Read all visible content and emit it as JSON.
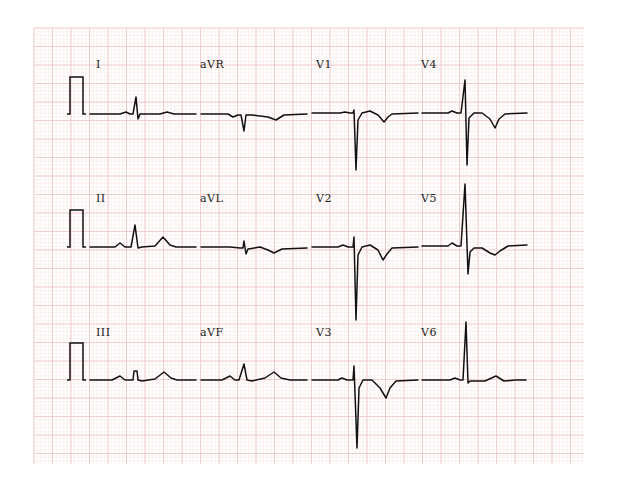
{
  "chart_data": {
    "type": "line",
    "grid": {
      "on": true,
      "x0": 34,
      "y0": 28,
      "x1": 584,
      "y1": 464,
      "major_px": 18.5,
      "minor_per_major": 5,
      "major_color": "#f0c8cc",
      "minor_color": "#fae8ea"
    },
    "layout": {
      "rows": 3,
      "columns": 4
    },
    "calibration_pulses": [
      {
        "row": 0,
        "x_left": 70,
        "x_right": 83,
        "baseline_y": 114,
        "top_y": 77
      },
      {
        "row": 1,
        "x_left": 70,
        "x_right": 83,
        "baseline_y": 247,
        "top_y": 210
      },
      {
        "row": 2,
        "x_left": 70,
        "x_right": 83,
        "baseline_y": 380,
        "top_y": 343
      }
    ],
    "leads": [
      {
        "name": "I",
        "label_x": 96,
        "label_y": 68,
        "baseline": 114,
        "points": [
          [
            90,
            114
          ],
          [
            120,
            114
          ],
          [
            126,
            112
          ],
          [
            130,
            114
          ],
          [
            133,
            114
          ],
          [
            136,
            97
          ],
          [
            138,
            119
          ],
          [
            140,
            114
          ],
          [
            160,
            114
          ],
          [
            167,
            112
          ],
          [
            174,
            114
          ],
          [
            196,
            114
          ]
        ]
      },
      {
        "name": "aVR",
        "label_x": 200,
        "label_y": 68,
        "baseline": 114,
        "points": [
          [
            201,
            114
          ],
          [
            228,
            114
          ],
          [
            233,
            117
          ],
          [
            238,
            115
          ],
          [
            241,
            115
          ],
          [
            244,
            131
          ],
          [
            246,
            115
          ],
          [
            252,
            115
          ],
          [
            268,
            117
          ],
          [
            276,
            120
          ],
          [
            284,
            115
          ],
          [
            307,
            114
          ]
        ]
      },
      {
        "name": "V1",
        "label_x": 316,
        "label_y": 68,
        "baseline": 113,
        "points": [
          [
            312,
            113
          ],
          [
            340,
            113
          ],
          [
            345,
            112
          ],
          [
            350,
            113
          ],
          [
            353,
            113
          ],
          [
            354,
            110
          ],
          [
            356,
            170
          ],
          [
            358,
            120
          ],
          [
            362,
            113
          ],
          [
            370,
            111
          ],
          [
            378,
            115
          ],
          [
            384,
            122
          ],
          [
            388,
            117
          ],
          [
            392,
            114
          ],
          [
            418,
            113
          ]
        ]
      },
      {
        "name": "V4",
        "label_x": 421,
        "label_y": 68,
        "baseline": 113,
        "points": [
          [
            422,
            113
          ],
          [
            448,
            113
          ],
          [
            452,
            111
          ],
          [
            457,
            113
          ],
          [
            461,
            113
          ],
          [
            465,
            80
          ],
          [
            467,
            165
          ],
          [
            469,
            118
          ],
          [
            474,
            113
          ],
          [
            482,
            113
          ],
          [
            490,
            119
          ],
          [
            495,
            128
          ],
          [
            499,
            119
          ],
          [
            505,
            114
          ],
          [
            527,
            113
          ]
        ]
      },
      {
        "name": "II",
        "label_x": 96,
        "label_y": 202,
        "baseline": 247,
        "points": [
          [
            90,
            247
          ],
          [
            115,
            247
          ],
          [
            120,
            243
          ],
          [
            125,
            247
          ],
          [
            131,
            247
          ],
          [
            135,
            225
          ],
          [
            138,
            248
          ],
          [
            142,
            247
          ],
          [
            155,
            246
          ],
          [
            163,
            237
          ],
          [
            170,
            245
          ],
          [
            176,
            247
          ],
          [
            196,
            247
          ]
        ]
      },
      {
        "name": "aVL",
        "label_x": 200,
        "label_y": 202,
        "baseline": 247,
        "points": [
          [
            201,
            247
          ],
          [
            230,
            247
          ],
          [
            240,
            248
          ],
          [
            243,
            248
          ],
          [
            244,
            241
          ],
          [
            246,
            254
          ],
          [
            248,
            249
          ],
          [
            260,
            247
          ],
          [
            268,
            250
          ],
          [
            274,
            253
          ],
          [
            282,
            249
          ],
          [
            307,
            248
          ]
        ]
      },
      {
        "name": "V2",
        "label_x": 316,
        "label_y": 202,
        "baseline": 247,
        "points": [
          [
            312,
            247
          ],
          [
            338,
            247
          ],
          [
            343,
            245
          ],
          [
            348,
            247
          ],
          [
            353,
            247
          ],
          [
            354,
            237
          ],
          [
            356,
            320
          ],
          [
            358,
            255
          ],
          [
            362,
            247
          ],
          [
            370,
            245
          ],
          [
            378,
            250
          ],
          [
            383,
            260
          ],
          [
            387,
            254
          ],
          [
            392,
            248
          ],
          [
            418,
            247
          ]
        ]
      },
      {
        "name": "V5",
        "label_x": 421,
        "label_y": 202,
        "baseline": 245,
        "points": [
          [
            422,
            246
          ],
          [
            448,
            246
          ],
          [
            452,
            243
          ],
          [
            457,
            246
          ],
          [
            461,
            246
          ],
          [
            465,
            184
          ],
          [
            468,
            274
          ],
          [
            470,
            252
          ],
          [
            474,
            248
          ],
          [
            482,
            248
          ],
          [
            490,
            253
          ],
          [
            495,
            255
          ],
          [
            500,
            251
          ],
          [
            508,
            246
          ],
          [
            527,
            245
          ]
        ]
      },
      {
        "name": "III",
        "label_x": 96,
        "label_y": 336,
        "baseline": 380,
        "points": [
          [
            90,
            380
          ],
          [
            112,
            380
          ],
          [
            120,
            376
          ],
          [
            125,
            380
          ],
          [
            133,
            380
          ],
          [
            134,
            371
          ],
          [
            137,
            371
          ],
          [
            138,
            380
          ],
          [
            142,
            381
          ],
          [
            155,
            379
          ],
          [
            164,
            372
          ],
          [
            171,
            378
          ],
          [
            177,
            380
          ],
          [
            196,
            380
          ]
        ]
      },
      {
        "name": "aVF",
        "label_x": 200,
        "label_y": 336,
        "baseline": 380,
        "points": [
          [
            201,
            380
          ],
          [
            222,
            380
          ],
          [
            230,
            376
          ],
          [
            235,
            380
          ],
          [
            239,
            380
          ],
          [
            244,
            364
          ],
          [
            247,
            380
          ],
          [
            252,
            381
          ],
          [
            265,
            378
          ],
          [
            274,
            372
          ],
          [
            281,
            378
          ],
          [
            290,
            380
          ],
          [
            307,
            380
          ]
        ]
      },
      {
        "name": "V3",
        "label_x": 316,
        "label_y": 336,
        "baseline": 380,
        "points": [
          [
            312,
            380
          ],
          [
            338,
            380
          ],
          [
            342,
            378
          ],
          [
            347,
            380
          ],
          [
            353,
            380
          ],
          [
            354,
            366
          ],
          [
            357,
            448
          ],
          [
            359,
            388
          ],
          [
            363,
            380
          ],
          [
            372,
            380
          ],
          [
            380,
            388
          ],
          [
            386,
            398
          ],
          [
            390,
            388
          ],
          [
            396,
            381
          ],
          [
            418,
            380
          ]
        ]
      },
      {
        "name": "V6",
        "label_x": 421,
        "label_y": 336,
        "baseline": 380,
        "points": [
          [
            422,
            380
          ],
          [
            450,
            380
          ],
          [
            455,
            378
          ],
          [
            460,
            380
          ],
          [
            463,
            380
          ],
          [
            466,
            322
          ],
          [
            468,
            383
          ],
          [
            470,
            381
          ],
          [
            485,
            381
          ],
          [
            496,
            376
          ],
          [
            504,
            381
          ],
          [
            515,
            380
          ],
          [
            526,
            380
          ]
        ]
      }
    ],
    "xlabel": "",
    "ylabel": "",
    "legend": null
  }
}
